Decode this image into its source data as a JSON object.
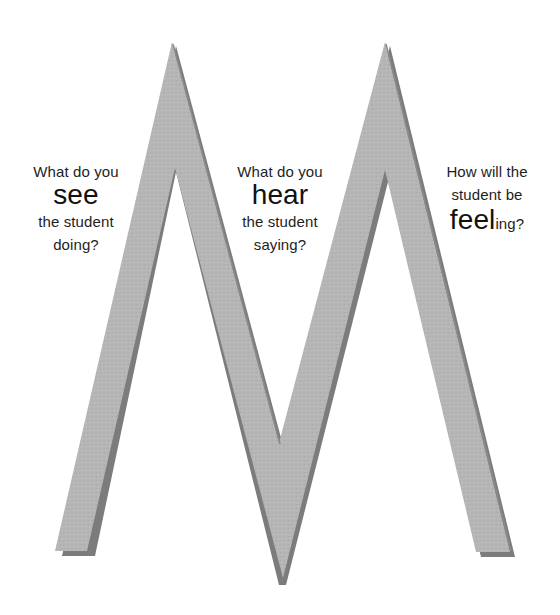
{
  "diagram": {
    "letter": "M",
    "colors": {
      "face": "#b4b4b4",
      "shadow": "#7c7c7c",
      "text": "#1e1e1e",
      "background": "#ffffff"
    },
    "prompts": [
      {
        "id": "see",
        "line1": "What do you",
        "keyword": "see",
        "line3": "the student",
        "line4": "doing?"
      },
      {
        "id": "hear",
        "line1": "What do you",
        "keyword": "hear",
        "line3": "the student",
        "line4": "saying?"
      },
      {
        "id": "feel",
        "line1": "How will the",
        "line2": "student be",
        "keyword": "feel",
        "suffix": "ing?"
      }
    ]
  }
}
